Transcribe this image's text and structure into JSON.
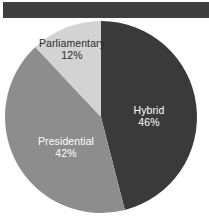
{
  "figure": {
    "background_color": "#ffffff",
    "top_bar": {
      "name": "top-banner",
      "color": "#3f3f3f"
    }
  },
  "chart_data": {
    "type": "pie",
    "title": "",
    "subtitle": "",
    "xlabel": "",
    "ylabel": "",
    "grid": false,
    "legend": "none",
    "label_position": "inside-slices",
    "start_angle_deg": 0,
    "direction": "clockwise",
    "categories": [
      "Hybrid",
      "Presidential",
      "Parliamentary"
    ],
    "values": [
      46,
      42,
      12
    ],
    "value_unit": "%",
    "colors": [
      "#3a3a3a",
      "#8d8d8d",
      "#d3d3d3"
    ],
    "slices": [
      {
        "label": "Hybrid",
        "value": 46,
        "value_text": "46%",
        "color": "#3a3a3a",
        "text_color": "#ffffff",
        "start_angle_deg": 0,
        "end_angle_deg": 165.6
      },
      {
        "label": "Presidential",
        "value": 42,
        "value_text": "42%",
        "color": "#8d8d8d",
        "text_color": "#ffffff",
        "start_angle_deg": 165.6,
        "end_angle_deg": 316.8
      },
      {
        "label": "Parliamentary",
        "value": 12,
        "value_text": "12%",
        "color": "#d3d3d3",
        "text_color": "#2b2b2b",
        "start_angle_deg": 316.8,
        "end_angle_deg": 360
      }
    ]
  }
}
